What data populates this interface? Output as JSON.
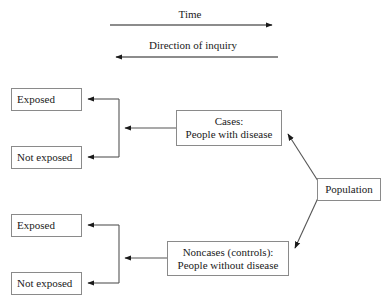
{
  "diagram": {
    "axis_labels": {
      "time": "Time",
      "inquiry": "Direction of inquiry"
    },
    "nodes": {
      "exposed_top": "Exposed",
      "not_exposed_top": "Not exposed",
      "exposed_bottom": "Exposed",
      "not_exposed_bottom": "Not exposed",
      "cases_line1": "Cases:",
      "cases_line2": "People with disease",
      "noncases_line1": "Noncases (controls):",
      "noncases_line2": "People without disease",
      "population": "Population"
    },
    "colors": {
      "box_border": "#8a8a8a",
      "line": "#1a1a1a",
      "background": "#ffffff",
      "text": "#1a1a1a"
    },
    "arrows": [
      {
        "name": "time-arrow",
        "direction": "right",
        "from_x": 110,
        "to_x": 278,
        "y": 25
      },
      {
        "name": "inquiry-arrow",
        "direction": "left",
        "from_x": 278,
        "to_x": 110,
        "y": 57
      },
      {
        "name": "cases-to-bracket",
        "direction": "left",
        "from_x": 176,
        "to_x": 119,
        "y": 128
      },
      {
        "name": "bracket-to-exposed-top",
        "direction": "left",
        "from_x": 119,
        "to_x": 82,
        "y": 99
      },
      {
        "name": "bracket-to-not-exposed-top",
        "direction": "left",
        "from_x": 119,
        "to_x": 82,
        "y": 157
      },
      {
        "name": "noncases-to-bracket",
        "direction": "left",
        "from_x": 167,
        "to_x": 119,
        "y": 258
      },
      {
        "name": "bracket-to-exposed-bottom",
        "direction": "left",
        "from_x": 119,
        "to_x": 82,
        "y": 225
      },
      {
        "name": "bracket-to-not-exposed-bottom",
        "direction": "left",
        "from_x": 119,
        "to_x": 82,
        "y": 283
      },
      {
        "name": "population-to-cases",
        "direction": "up-left",
        "from_x": 317,
        "from_y": 182,
        "to_x": 283,
        "to_y": 130
      },
      {
        "name": "population-to-noncases",
        "direction": "down-left",
        "from_x": 317,
        "from_y": 197,
        "to_x": 290,
        "to_y": 252
      }
    ]
  }
}
